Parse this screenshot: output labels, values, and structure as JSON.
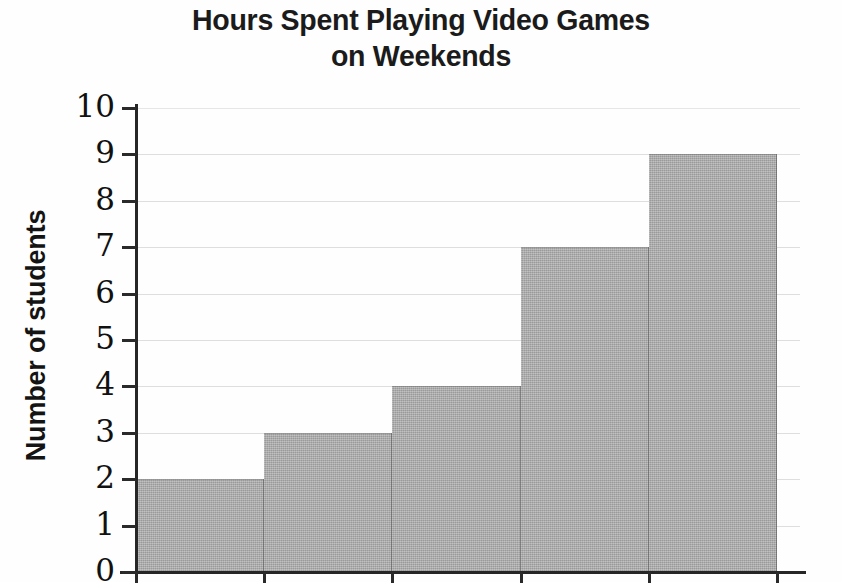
{
  "chart_data": {
    "type": "bar",
    "title": "Hours Spent Playing Video Games\non Weekends",
    "title_line1": "Hours Spent Playing Video Games",
    "title_line2": "on Weekends",
    "xlabel": "",
    "ylabel": "Number of students",
    "categories": [
      "1",
      "2",
      "3",
      "4",
      "5"
    ],
    "values": [
      2,
      3,
      4,
      7,
      9
    ],
    "ylim": [
      0,
      10
    ],
    "y_ticks": [
      0,
      1,
      2,
      3,
      4,
      5,
      6,
      7,
      8,
      9,
      10
    ],
    "y_tick_labels": [
      "0",
      "1",
      "2",
      "3",
      "4",
      "5",
      "6",
      "7",
      "8",
      "9",
      "10"
    ],
    "x_tick_labels": [],
    "grid": true,
    "grid_axis": "y",
    "legend": false,
    "legend_position": "none",
    "bar_style": "adjacent-histogram"
  },
  "style": {
    "background_color": "#ffffff",
    "bar_fill_color": "#acacac",
    "bar_edge_color": "#6e6e6e",
    "axis_color": "#262626",
    "grid_color": "#d8d8d8",
    "text_color": "#141414"
  }
}
